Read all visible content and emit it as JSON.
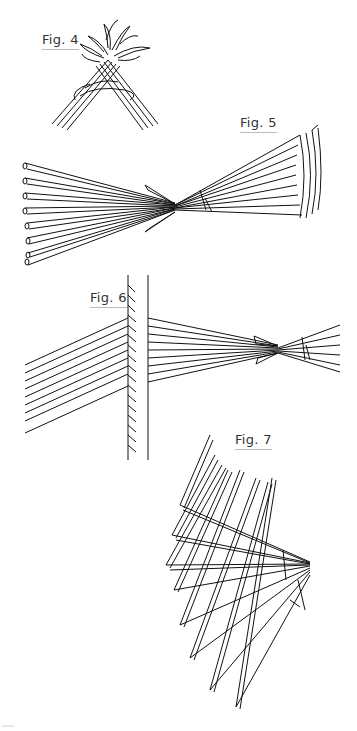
{
  "figures": [
    {
      "id": "fig4",
      "label": "Fig. 4",
      "description": "Crossed braided strips with leaves at top"
    },
    {
      "id": "fig5",
      "label": "Fig. 5",
      "description": "Fan of strips converging at center bow-tie"
    },
    {
      "id": "fig6",
      "label": "Fig. 6",
      "description": "Strips passing behind a vertical post with hatching"
    },
    {
      "id": "fig7",
      "label": "Fig. 7",
      "description": "Folded strips radiating from a point"
    }
  ],
  "colors": {
    "line": "#111111",
    "background": "#ffffff",
    "label": "#333333"
  }
}
